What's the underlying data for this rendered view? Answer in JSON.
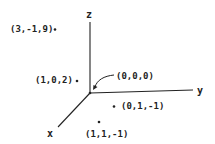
{
  "diagram": {
    "axes": {
      "x_label": "x",
      "y_label": "y",
      "z_label": "z"
    },
    "origin_label": "(0,0,0)",
    "points": [
      {
        "label": "(3,-1,9)"
      },
      {
        "label": "(1,0,2)"
      },
      {
        "label": "(0,1,-1)"
      },
      {
        "label": "(1,1,-1)"
      }
    ]
  }
}
